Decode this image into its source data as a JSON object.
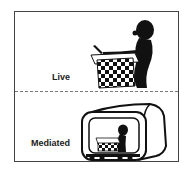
{
  "panels": [
    {
      "label": "Live",
      "illustration": "person-playing-chess-icon"
    },
    {
      "label": "Mediated",
      "illustration": "tv-showing-chess-player-icon"
    }
  ],
  "colors": {
    "ink": "#111111",
    "frame": "#444444",
    "divider": "#777777",
    "background": "#ffffff"
  }
}
